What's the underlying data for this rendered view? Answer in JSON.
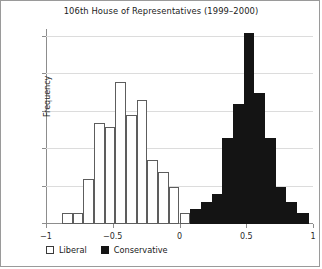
{
  "figure": {
    "title": "106th House of Representatives (1999–2000)",
    "legend": [
      {
        "label": "Liberal",
        "swatch": "open-square",
        "color": "#ffffff"
      },
      {
        "label": "Conservative",
        "swatch": "filled-square",
        "color": "#141414"
      }
    ]
  },
  "chart_data": {
    "type": "bar",
    "title": "106th House of Representatives (1999–2000)",
    "xlabel": "",
    "ylabel": "Frequency",
    "xlim": [
      -1,
      1
    ],
    "ylim": [
      0,
      52
    ],
    "grid": true,
    "legend_position": "below-axes-left",
    "xticks": [
      -1,
      -0.5,
      0,
      0.5,
      1
    ],
    "xtick_labels": [
      "−1",
      "−0.5",
      "0",
      "0.5",
      "1"
    ],
    "yticks": [
      0,
      10,
      20,
      30,
      40,
      50
    ],
    "ytick_labels": [
      "0",
      "10",
      "20",
      "30",
      "40",
      "50"
    ],
    "bin_width": 0.08,
    "series": [
      {
        "name": "Liberal",
        "color": "#ffffff",
        "edge_color": "#5d5d5d",
        "bins": [
          {
            "x0": -0.88,
            "x1": -0.8,
            "value": 3
          },
          {
            "x0": -0.8,
            "x1": -0.72,
            "value": 3
          },
          {
            "x0": -0.72,
            "x1": -0.64,
            "value": 12
          },
          {
            "x0": -0.64,
            "x1": -0.56,
            "value": 27
          },
          {
            "x0": -0.56,
            "x1": -0.48,
            "value": 26
          },
          {
            "x0": -0.48,
            "x1": -0.4,
            "value": 38
          },
          {
            "x0": -0.4,
            "x1": -0.32,
            "value": 29
          },
          {
            "x0": -0.32,
            "x1": -0.24,
            "value": 33
          },
          {
            "x0": -0.24,
            "x1": -0.16,
            "value": 17
          },
          {
            "x0": -0.16,
            "x1": -0.08,
            "value": 14
          },
          {
            "x0": -0.08,
            "x1": 0.0,
            "value": 10
          },
          {
            "x0": 0.0,
            "x1": 0.08,
            "value": 3
          }
        ]
      },
      {
        "name": "Conservative",
        "color": "#141414",
        "edge_color": "#141414",
        "bins": [
          {
            "x0": 0.08,
            "x1": 0.16,
            "value": 4
          },
          {
            "x0": 0.16,
            "x1": 0.24,
            "value": 6
          },
          {
            "x0": 0.24,
            "x1": 0.32,
            "value": 8
          },
          {
            "x0": 0.32,
            "x1": 0.4,
            "value": 23
          },
          {
            "x0": 0.4,
            "x1": 0.48,
            "value": 32
          },
          {
            "x0": 0.48,
            "x1": 0.56,
            "value": 51
          },
          {
            "x0": 0.56,
            "x1": 0.64,
            "value": 35
          },
          {
            "x0": 0.64,
            "x1": 0.72,
            "value": 23
          },
          {
            "x0": 0.72,
            "x1": 0.8,
            "value": 10
          },
          {
            "x0": 0.8,
            "x1": 0.88,
            "value": 6
          },
          {
            "x0": 0.88,
            "x1": 0.97,
            "value": 3
          }
        ]
      }
    ]
  }
}
